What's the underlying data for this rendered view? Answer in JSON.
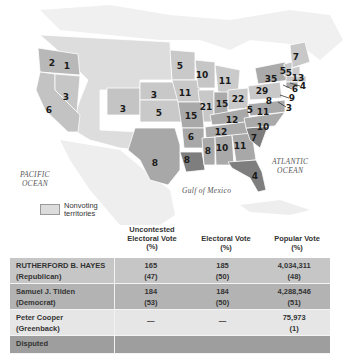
{
  "map": {
    "pacific_ocean": [
      "PACIFIC",
      "OCEAN"
    ],
    "atlantic_ocean": [
      "ATLANTIC",
      "OCEAN"
    ],
    "gulf_label": "Gulf of Mexico",
    "legend_label_line1": "Nonvoting",
    "legend_label_line2": "territories",
    "colors": {
      "republican": "#c9c9c9",
      "democrat": "#a9a9a9",
      "disputed": "#7d7d7d",
      "territory": "#e0e0e0",
      "foreign": "#efefef"
    },
    "state_labels": [
      {
        "v": "2",
        "x": 52,
        "y": 63
      },
      {
        "v": "1",
        "x": 67,
        "y": 66
      },
      {
        "v": "3",
        "x": 66,
        "y": 97
      },
      {
        "v": "6",
        "x": 49,
        "y": 110
      },
      {
        "v": "3",
        "x": 123,
        "y": 109
      },
      {
        "v": "3",
        "x": 154,
        "y": 95
      },
      {
        "v": "5",
        "x": 159,
        "y": 113
      },
      {
        "v": "8",
        "x": 155,
        "y": 163
      },
      {
        "v": "5",
        "x": 180,
        "y": 66
      },
      {
        "v": "10",
        "x": 202,
        "y": 75
      },
      {
        "v": "11",
        "x": 225,
        "y": 81
      },
      {
        "v": "11",
        "x": 185,
        "y": 93
      },
      {
        "v": "21",
        "x": 206,
        "y": 107
      },
      {
        "v": "15",
        "x": 222,
        "y": 104
      },
      {
        "v": "22",
        "x": 238,
        "y": 99
      },
      {
        "v": "15",
        "x": 191,
        "y": 116
      },
      {
        "v": "12",
        "x": 232,
        "y": 120
      },
      {
        "v": "5",
        "x": 250,
        "y": 110
      },
      {
        "v": "11",
        "x": 263,
        "y": 112
      },
      {
        "v": "29",
        "x": 262,
        "y": 91
      },
      {
        "v": "8",
        "x": 269,
        "y": 101
      },
      {
        "v": "35",
        "x": 271,
        "y": 79
      },
      {
        "v": "7",
        "x": 296,
        "y": 57
      },
      {
        "v": "5",
        "x": 283,
        "y": 71
      },
      {
        "v": "5",
        "x": 289,
        "y": 73
      },
      {
        "v": "13",
        "x": 298,
        "y": 78
      },
      {
        "v": "4",
        "x": 303,
        "y": 86
      },
      {
        "v": "6",
        "x": 295,
        "y": 89
      },
      {
        "v": "9",
        "x": 292,
        "y": 98
      },
      {
        "v": "3",
        "x": 289,
        "y": 108
      },
      {
        "v": "6",
        "x": 191,
        "y": 137
      },
      {
        "v": "12",
        "x": 221,
        "y": 132
      },
      {
        "v": "10",
        "x": 263,
        "y": 127
      },
      {
        "v": "7",
        "x": 254,
        "y": 138
      },
      {
        "v": "8",
        "x": 187,
        "y": 160
      },
      {
        "v": "8",
        "x": 208,
        "y": 151
      },
      {
        "v": "10",
        "x": 222,
        "y": 148
      },
      {
        "v": "11",
        "x": 240,
        "y": 146
      },
      {
        "v": "4",
        "x": 255,
        "y": 176
      }
    ]
  },
  "table": {
    "headers": [
      {
        "l1": "Uncontested",
        "l2": "Electoral Vote",
        "l3": "(%)"
      },
      {
        "l1": "",
        "l2": "Electoral Vote",
        "l3": "(%)"
      },
      {
        "l1": "",
        "l2": "Popular Vote",
        "l3": "(%)"
      }
    ],
    "rows": [
      {
        "name": "RUTHERFORD B. HAYES",
        "party": "(Republican)",
        "uncontested": "165",
        "uncontested_pct": "(47)",
        "electoral": "185",
        "electoral_pct": "(50)",
        "popular": "4,034,311",
        "popular_pct": "(48)"
      },
      {
        "name": "Samuel J. Tilden",
        "party": "(Democrat)",
        "uncontested": "184",
        "uncontested_pct": "(53)",
        "electoral": "184",
        "electoral_pct": "(50)",
        "popular": "4,288,546",
        "popular_pct": "(51)"
      },
      {
        "name": "Peter Cooper",
        "party": "(Greenback)",
        "uncontested": "—",
        "uncontested_pct": "",
        "electoral": "—",
        "electoral_pct": "",
        "popular": "75,973",
        "popular_pct": "(1)"
      },
      {
        "name": "Disputed",
        "party": "",
        "uncontested": "",
        "uncontested_pct": "",
        "electoral": "",
        "electoral_pct": "",
        "popular": "",
        "popular_pct": ""
      }
    ]
  }
}
